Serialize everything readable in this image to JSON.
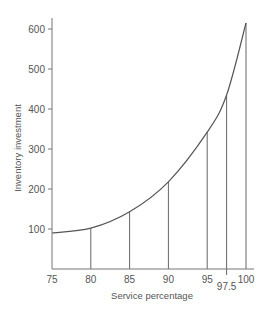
{
  "chart_data": {
    "type": "line",
    "title": "",
    "xlabel": "Service percentage",
    "ylabel": "Inventory investment",
    "xlim": [
      75,
      100
    ],
    "ylim": [
      0,
      600
    ],
    "grid": false,
    "legend": null,
    "x_ticks": [
      75,
      80,
      85,
      90,
      95,
      100
    ],
    "x_tick_labels": [
      "75",
      "80",
      "85",
      "90",
      "95",
      "100"
    ],
    "extra_x_tick": {
      "value": 97.5,
      "label": "97.5"
    },
    "y_ticks": [
      100,
      200,
      300,
      400,
      500,
      600
    ],
    "y_tick_labels": [
      "100",
      "200",
      "300",
      "400",
      "500",
      "600"
    ],
    "series": [
      {
        "name": "Inventory investment curve",
        "x": [
          75,
          80,
          85,
          90,
          95,
          97.5,
          100
        ],
        "y": [
          90,
          102,
          143,
          218,
          342,
          435,
          615
        ]
      }
    ],
    "drop_lines_at_x": [
      80,
      85,
      90,
      95,
      97.5,
      100
    ],
    "colors": {
      "line": "#555555",
      "axis": "#777777",
      "text": "#555555"
    }
  }
}
